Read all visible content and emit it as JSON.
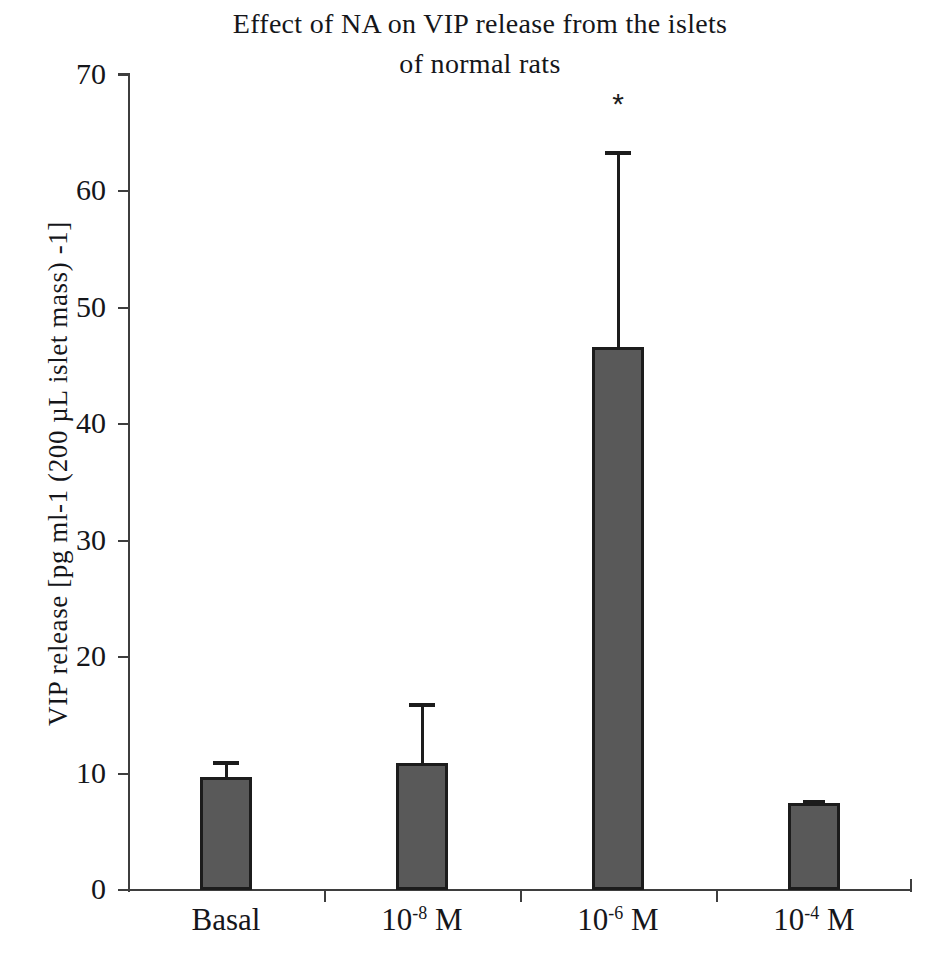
{
  "chart_data": {
    "type": "bar",
    "title": "Effect of NA on VIP release from  the islets\nof normal rats",
    "title_line1": "Effect of NA on VIP release from  the islets",
    "title_line2": "of normal rats",
    "xlabel": "",
    "ylabel": "VIP release [pg ml-1 (200 µL islet mass) -1]",
    "ylim": [
      0,
      70
    ],
    "yticks": [
      0,
      10,
      20,
      30,
      40,
      50,
      60,
      70
    ],
    "ytick_labels": [
      "0",
      "10",
      "20",
      "30",
      "40",
      "50",
      "60",
      "70"
    ],
    "grid": false,
    "legend": null,
    "categories": [
      "Basal",
      "10-8 M",
      "10-6 M",
      "10-4 M"
    ],
    "category_labels": [
      {
        "base": "Basal",
        "exponent": "",
        "suffix": ""
      },
      {
        "base": "10",
        "exponent": "-8",
        "suffix": " M"
      },
      {
        "base": "10",
        "exponent": "-6",
        "suffix": " M"
      },
      {
        "base": "10",
        "exponent": "-4",
        "suffix": " M"
      }
    ],
    "values": [
      9.7,
      10.9,
      46.6,
      7.5
    ],
    "errors_upper": [
      1.4,
      5.2,
      16.9,
      0.2
    ],
    "error_tops": [
      11.1,
      16.1,
      63.5,
      7.7
    ],
    "annotations": [
      {
        "category": "10-6 M",
        "text": "*",
        "value": 67.5
      }
    ],
    "bar_color": "#595959",
    "bar_edge_color": "#1c1c1c",
    "axis_color": "#3e3e3e",
    "background_color": "#ffffff"
  },
  "axis": {
    "y_title": "VIP release [pg ml-1 (200 µL islet mass) -1]"
  }
}
